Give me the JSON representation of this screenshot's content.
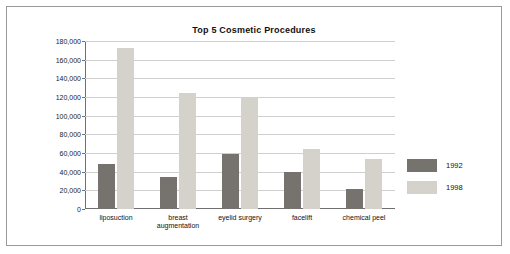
{
  "chart_data": {
    "type": "bar",
    "title": "Top 5 Cosmetic Procedures",
    "xlabel": "",
    "ylabel": "",
    "ylim": [
      0,
      180000
    ],
    "ytick_step": 20000,
    "yticks": [
      "0",
      "20,000",
      "40,000",
      "60,000",
      "80,000",
      "100,000",
      "120,000",
      "140,000",
      "160,000",
      "180,000"
    ],
    "grid": true,
    "legend_position": "right",
    "categories": [
      "liposuction",
      "breast augmentation",
      "eyelid surgery",
      "facelift",
      "chemical peel"
    ],
    "series": [
      {
        "name": "1992",
        "color": "#76736f",
        "values": [
          48000,
          34000,
          59000,
          40000,
          21000
        ]
      },
      {
        "name": "1998",
        "color": "#d5d2cc",
        "values": [
          173000,
          124000,
          120000,
          64000,
          54000
        ]
      }
    ]
  },
  "colors": {
    "series_1992": "#76736f",
    "series_1998": "#d5d2cc",
    "grid": "#cfcfcf",
    "axis": "#6f6f6f",
    "border": "#9a9a9a",
    "text": "#111111"
  }
}
